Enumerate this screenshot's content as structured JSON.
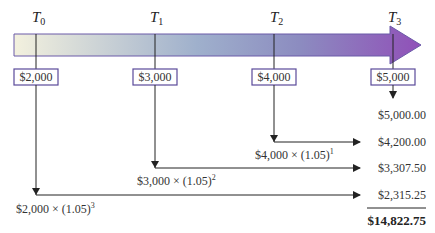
{
  "timeline": {
    "periods": [
      {
        "label": "T",
        "sub": "0"
      },
      {
        "label": "T",
        "sub": "1"
      },
      {
        "label": "T",
        "sub": "2"
      },
      {
        "label": "T",
        "sub": "3"
      }
    ],
    "colors": {
      "arrow_start": "#f2f0dc",
      "arrow_mid": "#8fa2c4",
      "arrow_end": "#8e55b8",
      "box_border": "#5a4a9a",
      "line": "#222222"
    }
  },
  "deposits": [
    "$2,000",
    "$3,000",
    "$4,000",
    "$5,000"
  ],
  "formulas": [
    {
      "base": "$2,000 × (1.05)",
      "exp": "3"
    },
    {
      "base": "$3,000 × (1.05)",
      "exp": "2"
    },
    {
      "base": "$4,000 × (1.05)",
      "exp": "1"
    }
  ],
  "future_values": [
    "$5,000.00",
    "$4,200.00",
    "$3,307.50",
    "$2,315.25"
  ],
  "total": "$14,822.75"
}
